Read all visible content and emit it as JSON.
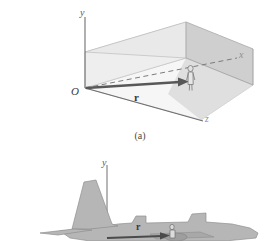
{
  "figure": {
    "background_color": "#ffffff"
  },
  "panel_a": {
    "caption": "(a)",
    "axes": {
      "y_label": "y",
      "x_label": "x",
      "z_label": "z",
      "origin_label": "O"
    },
    "vector_label": "r",
    "subject": "person-figure",
    "colors": {
      "box_top": "#ececec",
      "box_left_wall": "#e3e3e3",
      "box_back_wall": "#e6e6e6",
      "box_right_wall": "#c9c9c9",
      "box_floor": "#f4f4f4",
      "outline": "#9a9a9a",
      "axis": "#6e6e6e",
      "vector": "#5c5c5c",
      "dashed_axis": "#7a7a7a"
    }
  },
  "panel_b": {
    "axes": {
      "y_label": "y"
    },
    "vector_label": "r",
    "subject": "airplane-silhouette",
    "colors": {
      "airplane_body": "#b3b3b3",
      "airplane_outline": "#8c8c8c",
      "axis": "#6e6e6e",
      "vector": "#4a4a4a"
    }
  }
}
